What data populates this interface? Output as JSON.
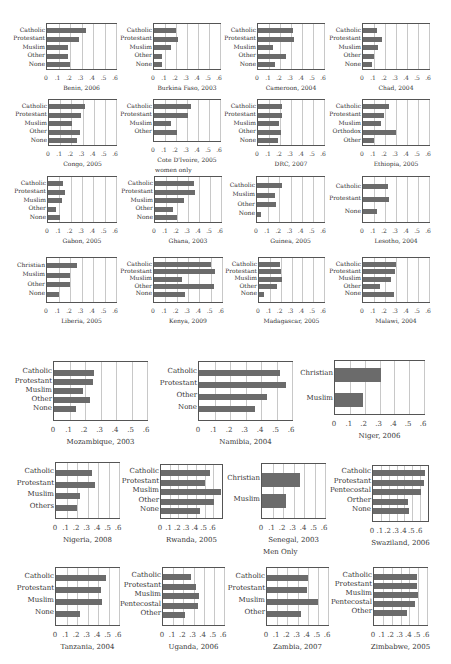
{
  "chart_data": [
    {
      "type": "bar",
      "title": "Benin, 2006",
      "categories": [
        "Catholic",
        "Protestant",
        "Muslim",
        "Other",
        "None"
      ],
      "values": [
        0.34,
        0.28,
        0.18,
        0.18,
        0.2
      ],
      "xlim": [
        0,
        0.6
      ],
      "ticks": [
        "0",
        ".1",
        ".2",
        ".3",
        ".4",
        ".5",
        ".6"
      ],
      "grid": true
    },
    {
      "type": "bar",
      "title": "Burkina Faso, 2003",
      "categories": [
        "Catholic",
        "Protestant",
        "Muslim",
        "Other",
        "None"
      ],
      "values": [
        0.2,
        0.22,
        0.15,
        0.07,
        0.07
      ],
      "xlim": [
        0,
        0.6
      ],
      "ticks": [
        "0",
        ".1",
        ".2",
        ".3",
        ".4",
        ".5",
        ".6"
      ],
      "grid": true
    },
    {
      "type": "bar",
      "title": "Cameroon, 2004",
      "categories": [
        "Catholic",
        "Protestant",
        "Muslim",
        "Other",
        "None"
      ],
      "values": [
        0.32,
        0.33,
        0.14,
        0.25,
        0.15
      ],
      "xlim": [
        0,
        0.6
      ],
      "ticks": [
        "0",
        ".1",
        ".2",
        ".3",
        ".4",
        ".5",
        ".6"
      ],
      "grid": true
    },
    {
      "type": "bar",
      "title": "Chad, 2004",
      "categories": [
        "Catholic",
        "Protestant",
        "Muslim",
        "Other",
        "None"
      ],
      "values": [
        0.13,
        0.17,
        0.14,
        0.1,
        0.08
      ],
      "xlim": [
        0,
        0.6
      ],
      "ticks": [
        "0",
        ".1",
        ".2",
        ".3",
        ".4",
        ".5",
        ".6"
      ],
      "grid": true
    },
    {
      "type": "bar",
      "title": "Congo, 2005",
      "categories": [
        "Catholic",
        "Protestant",
        "Muslim",
        "Other",
        "None"
      ],
      "values": [
        0.32,
        0.29,
        0.21,
        0.28,
        0.25
      ],
      "xlim": [
        0,
        0.6
      ],
      "ticks": [
        "0",
        ".1",
        ".2",
        ".3",
        ".4",
        ".5",
        ".6"
      ],
      "grid": true
    },
    {
      "type": "bar",
      "title": "Cote D'Ivoire, 2005",
      "subtitle": "women only",
      "categories": [
        "Catholic",
        "Protestant",
        "Muslim",
        "Other"
      ],
      "values": [
        0.34,
        0.31,
        0.15,
        0.21
      ],
      "xlim": [
        0,
        0.6
      ],
      "ticks": [
        "0",
        ".1",
        ".2",
        ".3",
        ".4",
        ".5",
        ".6"
      ],
      "grid": true
    },
    {
      "type": "bar",
      "title": "DRC, 2007",
      "categories": [
        "Catholic",
        "Protestant",
        "Muslim",
        "Other",
        "None"
      ],
      "values": [
        0.22,
        0.22,
        0.19,
        0.21,
        0.18
      ],
      "xlim": [
        0,
        0.6
      ],
      "ticks": [
        "0",
        ".1",
        ".2",
        ".3",
        ".4",
        ".5",
        ".6"
      ],
      "grid": true
    },
    {
      "type": "bar",
      "title": "Ethiopia, 2005",
      "categories": [
        "Catholic",
        "Protestant",
        "Muslim",
        "Orthodox",
        "Other"
      ],
      "values": [
        0.24,
        0.19,
        0.16,
        0.3,
        0.1
      ],
      "xlim": [
        0,
        0.6
      ],
      "ticks": [
        "0",
        ".1",
        ".2",
        ".3",
        ".4",
        ".5",
        ".6"
      ],
      "grid": true
    },
    {
      "type": "bar",
      "title": "Gabon, 2005",
      "categories": [
        "Catholic",
        "Protestant",
        "Muslim",
        "Other",
        "None"
      ],
      "values": [
        0.13,
        0.15,
        0.12,
        0.07,
        0.11
      ],
      "xlim": [
        0,
        0.6
      ],
      "ticks": [
        "0",
        ".1",
        ".2",
        ".3",
        ".4",
        ".5",
        ".6"
      ],
      "grid": true
    },
    {
      "type": "bar",
      "title": "Ghana, 2003",
      "categories": [
        "Catholic",
        "Protestant",
        "Muslim",
        "Other",
        "None"
      ],
      "values": [
        0.35,
        0.36,
        0.26,
        0.16,
        0.2
      ],
      "xlim": [
        0,
        0.6
      ],
      "ticks": [
        "0",
        ".1",
        ".2",
        ".3",
        ".4",
        ".5",
        ".6"
      ],
      "grid": true
    },
    {
      "type": "bar",
      "title": "Guinea, 2005",
      "categories": [
        "Catholic",
        "Muslim",
        "Other",
        "None"
      ],
      "values": [
        0.22,
        0.16,
        0.17,
        0.04
      ],
      "xlim": [
        0,
        0.6
      ],
      "ticks": [
        "0",
        ".1",
        ".2",
        ".3",
        ".4",
        ".5",
        ".6"
      ],
      "grid": true
    },
    {
      "type": "bar",
      "title": "Lesotho, 2004",
      "categories": [
        "Catholic",
        "Protestant",
        "None"
      ],
      "values": [
        0.23,
        0.24,
        0.13
      ],
      "xlim": [
        0,
        0.6
      ],
      "ticks": [
        "0",
        ".1",
        ".2",
        ".3",
        ".4",
        ".5",
        ".6"
      ],
      "grid": true
    },
    {
      "type": "bar",
      "title": "Liberia, 2005",
      "categories": [
        "Christian",
        "Muslim",
        "Other",
        "None"
      ],
      "values": [
        0.26,
        0.2,
        0.2,
        0.1
      ],
      "xlim": [
        0,
        0.6
      ],
      "ticks": [
        "0",
        ".1",
        ".2",
        ".3",
        ".4",
        ".5",
        ".6"
      ],
      "grid": true
    },
    {
      "type": "bar",
      "title": "Kenya, 2009",
      "categories": [
        "Catholic",
        "Protestant",
        "Muslim",
        "Other",
        "None"
      ],
      "values": [
        0.5,
        0.54,
        0.25,
        0.53,
        0.27
      ],
      "xlim": [
        0,
        0.6
      ],
      "ticks": [
        "0",
        ".1",
        ".2",
        ".3",
        ".4",
        ".5",
        ".6"
      ],
      "grid": true
    },
    {
      "type": "bar",
      "title": "Madagascar, 2005",
      "categories": [
        "Catholic",
        "Protestant",
        "Muslim",
        "Other",
        "None"
      ],
      "values": [
        0.19,
        0.2,
        0.21,
        0.17,
        0.05
      ],
      "xlim": [
        0,
        0.6
      ],
      "ticks": [
        "0",
        ".1",
        ".2",
        ".3",
        ".4",
        ".5",
        ".6"
      ],
      "grid": true
    },
    {
      "type": "bar",
      "title": "Malawi, 2004",
      "categories": [
        "Catholic",
        "Protestant",
        "Muslim",
        "Other",
        "None"
      ],
      "values": [
        0.3,
        0.29,
        0.25,
        0.15,
        0.28
      ],
      "xlim": [
        0,
        0.6
      ],
      "ticks": [
        "0",
        ".1",
        ".2",
        ".3",
        ".4",
        ".5",
        ".6"
      ],
      "grid": true
    },
    {
      "type": "bar",
      "title": "Mozambique, 2003",
      "categories": [
        "Catholic",
        "Protestant",
        "Muslim",
        "Other",
        "None"
      ],
      "values": [
        0.26,
        0.25,
        0.19,
        0.23,
        0.14
      ],
      "xlim": [
        0,
        0.6
      ],
      "ticks": [
        "0",
        ".1",
        ".2",
        ".3",
        ".4",
        ".5",
        ".6"
      ],
      "grid": true
    },
    {
      "type": "bar",
      "title": "Namibia, 2004",
      "categories": [
        "Catholic",
        "Protestant",
        "Other",
        "None"
      ],
      "values": [
        0.52,
        0.56,
        0.44,
        0.36
      ],
      "xlim": [
        0,
        0.6
      ],
      "ticks": [
        "0",
        ".1",
        ".2",
        ".3",
        ".4",
        ".5",
        ".6"
      ],
      "grid": true
    },
    {
      "type": "bar",
      "title": "Niger, 2006",
      "categories": [
        "Christian",
        "Muslim"
      ],
      "values": [
        0.31,
        0.19
      ],
      "xlim": [
        0,
        0.6
      ],
      "ticks": [
        "0",
        ".1",
        ".2",
        ".3",
        ".4",
        ".5",
        ".6"
      ],
      "grid": true
    },
    {
      "type": "bar",
      "title": "Nigeria, 2008",
      "categories": [
        "Catholic",
        "Protestant",
        "Muslim",
        "Others"
      ],
      "values": [
        0.34,
        0.37,
        0.23,
        0.2
      ],
      "xlim": [
        0,
        0.6
      ],
      "ticks": [
        "0",
        ".1",
        ".2",
        ".3",
        ".4",
        ".5",
        ".6"
      ],
      "grid": true
    },
    {
      "type": "bar",
      "title": "Rwanda, 2005",
      "categories": [
        "Catholic",
        "Protestant",
        "Muslim",
        "Other",
        "None"
      ],
      "values": [
        0.56,
        0.51,
        0.69,
        0.61,
        0.45
      ],
      "xlim": [
        0,
        0.7
      ],
      "ticks": [
        "0",
        ".1",
        ".2",
        ".3",
        ".4",
        ".5",
        ".6"
      ],
      "grid": true
    },
    {
      "type": "bar",
      "title": "Senegal, 2003",
      "subtitle": "Men Only",
      "categories": [
        "Christian",
        "Muslim"
      ],
      "values": [
        0.36,
        0.23
      ],
      "xlim": [
        0,
        0.6
      ],
      "ticks": [
        "0",
        ".1",
        ".2",
        ".3",
        ".4",
        ".5",
        ".6"
      ],
      "grid": true
    },
    {
      "type": "bar",
      "title": "Swaziland, 2006",
      "categories": [
        "Catholic",
        "Protestant",
        "Pentecostal",
        "Orther",
        "None"
      ],
      "values": [
        0.66,
        0.65,
        0.61,
        0.45,
        0.46
      ],
      "xlim": [
        0,
        0.7
      ],
      "ticks": [
        "0",
        ".1",
        ".2",
        ".3",
        ".4",
        ".5",
        ".6"
      ],
      "grid": true
    },
    {
      "type": "bar",
      "title": "Tanzania, 2004",
      "categories": [
        "Catholic",
        "Protestant",
        "Muslim",
        "None"
      ],
      "values": [
        0.48,
        0.43,
        0.44,
        0.23
      ],
      "xlim": [
        0,
        0.6
      ],
      "ticks": [
        "0",
        ".1",
        ".2",
        ".3",
        ".4",
        ".5",
        ".6"
      ],
      "grid": true
    },
    {
      "type": "bar",
      "title": "Uganda, 2006",
      "categories": [
        "Catholic",
        "Protestant",
        "Muslim",
        "Pentecostal",
        "Other"
      ],
      "values": [
        0.28,
        0.32,
        0.35,
        0.34,
        0.22
      ],
      "xlim": [
        0,
        0.6
      ],
      "ticks": [
        "0",
        ".1",
        ".2",
        ".3",
        ".4",
        ".5",
        ".6"
      ],
      "grid": true
    },
    {
      "type": "bar",
      "title": "Zambia, 2007",
      "categories": [
        "Catholic",
        "Protestant",
        "Muslim",
        "Other"
      ],
      "values": [
        0.4,
        0.39,
        0.5,
        0.33
      ],
      "xlim": [
        0,
        0.6
      ],
      "ticks": [
        "0",
        ".1",
        ".2",
        ".3",
        ".4",
        ".5",
        ".6"
      ],
      "grid": true
    },
    {
      "type": "bar",
      "title": "Zimbabwe, 2005",
      "categories": [
        "Catholic",
        "Protestant",
        "Muslim",
        "Pentecostal",
        "Other"
      ],
      "values": [
        0.49,
        0.49,
        0.5,
        0.46,
        0.37
      ],
      "xlim": [
        0,
        0.6
      ],
      "ticks": [
        "0",
        ".1",
        ".2",
        ".3",
        ".4",
        ".5",
        ".6"
      ],
      "grid": true
    }
  ],
  "layout": [
    {
      "x": 46,
      "y": 23,
      "w": 71,
      "h": 47,
      "fs": 6,
      "rowStart": 4,
      "rowStep": 8.6,
      "bh": 5,
      "labelW": 44,
      "tickY": 4,
      "titleY": 14,
      "scaleMax": 0.6
    },
    {
      "x": 153,
      "y": 23,
      "w": 68,
      "h": 47,
      "fs": 6,
      "rowStart": 4,
      "rowStep": 8.6,
      "bh": 5,
      "labelW": 44,
      "tickY": 4,
      "titleY": 14,
      "scaleMax": 0.6
    },
    {
      "x": 257,
      "y": 23,
      "w": 68,
      "h": 47,
      "fs": 6,
      "rowStart": 4,
      "rowStep": 8.6,
      "bh": 5,
      "labelW": 44,
      "tickY": 4,
      "titleY": 14,
      "scaleMax": 0.6
    },
    {
      "x": 362,
      "y": 23,
      "w": 68,
      "h": 47,
      "fs": 6,
      "rowStart": 4,
      "rowStep": 8.6,
      "bh": 5,
      "labelW": 44,
      "tickY": 4,
      "titleY": 14,
      "scaleMax": 0.6
    },
    {
      "x": 48,
      "y": 99,
      "w": 69,
      "h": 47,
      "fs": 6,
      "rowStart": 4,
      "rowStep": 8.6,
      "bh": 5,
      "labelW": 44,
      "tickY": 4,
      "titleY": 14,
      "scaleMax": 0.6
    },
    {
      "x": 153,
      "y": 99,
      "w": 68,
      "h": 43,
      "fs": 6,
      "rowStart": 4,
      "rowStep": 8.6,
      "bh": 5,
      "labelW": 44,
      "tickY": 4,
      "titleY": 14,
      "scaleMax": 0.6
    },
    {
      "x": 257,
      "y": 99,
      "w": 68,
      "h": 47,
      "fs": 6,
      "rowStart": 4,
      "rowStep": 8.6,
      "bh": 5,
      "labelW": 44,
      "tickY": 4,
      "titleY": 14,
      "scaleMax": 0.6
    },
    {
      "x": 362,
      "y": 99,
      "w": 68,
      "h": 47,
      "fs": 6,
      "rowStart": 4,
      "rowStep": 8.6,
      "bh": 5,
      "labelW": 44,
      "tickY": 4,
      "titleY": 14,
      "scaleMax": 0.6
    },
    {
      "x": 47,
      "y": 176,
      "w": 70,
      "h": 47,
      "fs": 6,
      "rowStart": 4,
      "rowStep": 8.6,
      "bh": 5,
      "labelW": 44,
      "tickY": 4,
      "titleY": 14,
      "scaleMax": 0.6
    },
    {
      "x": 154,
      "y": 176,
      "w": 68,
      "h": 47,
      "fs": 6,
      "rowStart": 4,
      "rowStep": 8.6,
      "bh": 5,
      "labelW": 44,
      "tickY": 4,
      "titleY": 14,
      "scaleMax": 0.6
    },
    {
      "x": 256,
      "y": 176,
      "w": 69,
      "h": 47,
      "fs": 6,
      "rowStart": 6,
      "rowStep": 9.5,
      "bh": 5,
      "labelW": 44,
      "tickY": 4,
      "titleY": 14,
      "scaleMax": 0.6
    },
    {
      "x": 362,
      "y": 176,
      "w": 68,
      "h": 47,
      "fs": 6,
      "rowStart": 7,
      "rowStep": 12.5,
      "bh": 5,
      "labelW": 44,
      "tickY": 4,
      "titleY": 14,
      "scaleMax": 0.6
    },
    {
      "x": 46,
      "y": 257,
      "w": 71,
      "h": 46,
      "fs": 6,
      "rowStart": 5,
      "rowStep": 9.6,
      "bh": 5,
      "labelW": 44,
      "tickY": 4,
      "titleY": 14,
      "scaleMax": 0.6
    },
    {
      "x": 153,
      "y": 257,
      "w": 70,
      "h": 46,
      "fs": 6,
      "rowStart": 4,
      "rowStep": 7.4,
      "bh": 5,
      "labelW": 44,
      "tickY": 4,
      "titleY": 14,
      "scaleMax": 0.6
    },
    {
      "x": 258,
      "y": 257,
      "w": 67,
      "h": 46,
      "fs": 6,
      "rowStart": 4,
      "rowStep": 7.4,
      "bh": 5,
      "labelW": 44,
      "tickY": 4,
      "titleY": 14,
      "scaleMax": 0.6
    },
    {
      "x": 362,
      "y": 257,
      "w": 68,
      "h": 46,
      "fs": 6,
      "rowStart": 4,
      "rowStep": 7.4,
      "bh": 5,
      "labelW": 44,
      "tickY": 4,
      "titleY": 14,
      "scaleMax": 0.6
    },
    {
      "x": 53,
      "y": 361,
      "w": 95,
      "h": 60,
      "fs": 7,
      "rowStart": 8,
      "rowStep": 9.1,
      "bh": 6,
      "labelW": 55,
      "tickY": 5,
      "titleY": 17,
      "scaleMax": 0.6
    },
    {
      "x": 198,
      "y": 361,
      "w": 95,
      "h": 60,
      "fs": 7,
      "rowStart": 8,
      "rowStep": 12,
      "bh": 6,
      "labelW": 55,
      "tickY": 5,
      "titleY": 17,
      "scaleMax": 0.6
    },
    {
      "x": 334,
      "y": 360,
      "w": 91,
      "h": 55,
      "fs": 7,
      "rowStart": 7,
      "rowStep": 25,
      "bh": 14,
      "labelW": 55,
      "tickY": 5,
      "titleY": 17,
      "scaleMax": 0.6
    },
    {
      "x": 55,
      "y": 462,
      "w": 65,
      "h": 57,
      "fs": 7,
      "rowStart": 7,
      "rowStep": 11.5,
      "bh": 6,
      "labelW": 55,
      "tickY": 5,
      "titleY": 17,
      "scaleMax": 0.6
    },
    {
      "x": 160,
      "y": 464,
      "w": 63,
      "h": 55,
      "fs": 7,
      "rowStart": 5,
      "rowStep": 9.5,
      "bh": 6,
      "labelW": 55,
      "tickY": 5,
      "titleY": 17,
      "scaleMax": 0.6
    },
    {
      "x": 261,
      "y": 463,
      "w": 65,
      "h": 56,
      "fs": 7,
      "rowStart": 9,
      "rowStep": 21,
      "bh": 14,
      "labelW": 55,
      "tickY": 5,
      "titleY": 17,
      "scaleMax": 0.6
    },
    {
      "x": 372,
      "y": 465,
      "w": 57,
      "h": 57,
      "fs": 7,
      "rowStart": 4,
      "rowStep": 9.5,
      "bh": 6,
      "labelW": 55,
      "tickY": 5,
      "titleY": 17,
      "scaleMax": 0.6
    },
    {
      "x": 55,
      "y": 567,
      "w": 65,
      "h": 59,
      "fs": 7,
      "rowStart": 7,
      "rowStep": 12,
      "bh": 6,
      "labelW": 55,
      "tickY": 5,
      "titleY": 17,
      "scaleMax": 0.6
    },
    {
      "x": 162,
      "y": 567,
      "w": 63,
      "h": 59,
      "fs": 7,
      "rowStart": 6,
      "rowStep": 9.5,
      "bh": 6,
      "labelW": 55,
      "tickY": 5,
      "titleY": 17,
      "scaleMax": 0.6
    },
    {
      "x": 266,
      "y": 567,
      "w": 63,
      "h": 59,
      "fs": 7,
      "rowStart": 7,
      "rowStep": 12,
      "bh": 6,
      "labelW": 55,
      "tickY": 5,
      "titleY": 17,
      "scaleMax": 0.6
    },
    {
      "x": 373,
      "y": 567,
      "w": 55,
      "h": 59,
      "fs": 7,
      "rowStart": 6,
      "rowStep": 9,
      "bh": 6,
      "labelW": 55,
      "tickY": 5,
      "titleY": 17,
      "scaleMax": 0.6
    }
  ]
}
